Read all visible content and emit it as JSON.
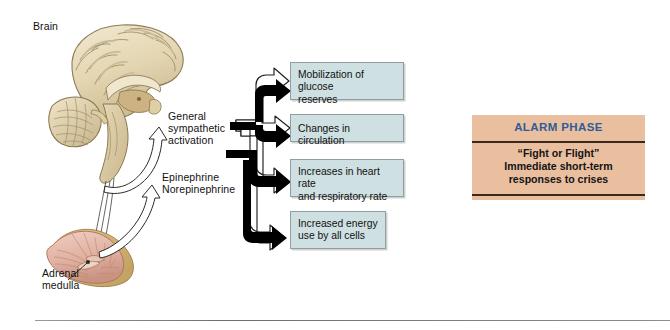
{
  "figure": {
    "labels": {
      "brain": "Brain",
      "general_sympathetic": "General\nsympathetic\nactivation",
      "epinephrine": "Epinephrine\nNorepinephrine",
      "adrenal_medulla": "Adrenal\nmedulla"
    },
    "outcome_boxes": [
      {
        "id": "glucose",
        "text": "Mobilization of glucose\nreserves"
      },
      {
        "id": "circulation",
        "text": "Changes in circulation"
      },
      {
        "id": "heart",
        "text": "Increases in heart rate\nand respiratory rate"
      },
      {
        "id": "energy",
        "text": "Increased energy\nuse by all cells"
      }
    ],
    "alarm_panel": {
      "title": "ALARM PHASE",
      "body": "“Fight or Flight”\nImmediate short-term\nresponses to crises"
    },
    "colors": {
      "box_fill": "#cfe0e2",
      "box_border": "#8e9ea1",
      "alarm_fill": "#e9bf9f",
      "alarm_title_text": "#2f5c96",
      "alarm_rule": "#3a2a1c",
      "brain_tan": "#e2d5b4",
      "adrenal_pink": "#e0b3a3",
      "arrow_outline": "#1a1a1a",
      "arrow_fill_hollow": "#ffffff",
      "arrow_fill_solid": "#000000",
      "page_background": "#ffffff",
      "bottom_rule": "#808080"
    },
    "icons": {
      "brain": "brain-sagittal-illustration",
      "adrenal": "adrenal-gland-illustration",
      "hollow_arrow": "hollow-arrow-icon",
      "solid_arrow": "solid-arrow-icon",
      "nerve_fiber": "nerve-fiber-line"
    }
  }
}
